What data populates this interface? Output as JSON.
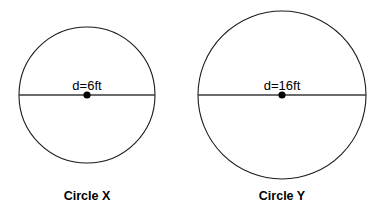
{
  "figure": {
    "background_color": "#ffffff",
    "stroke_color": "#1a1a1a",
    "text_color": "#000000"
  },
  "circles": [
    {
      "id": "circle-x",
      "caption": "Circle X",
      "dimension_label": "d=6ft",
      "diameter_value": 6,
      "units": "ft",
      "center": {
        "x": 87,
        "y": 95
      },
      "radius_px": 68
    },
    {
      "id": "circle-y",
      "caption": "Circle Y",
      "dimension_label": "d=16ft",
      "diameter_value": 16,
      "units": "ft",
      "center": {
        "x": 282,
        "y": 95
      },
      "radius_px": 84
    }
  ]
}
